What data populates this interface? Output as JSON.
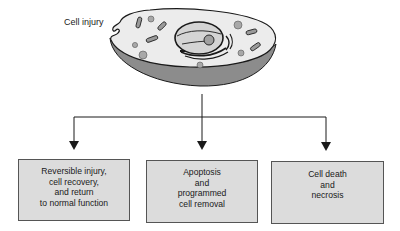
{
  "diagram": {
    "title": "Cell injury",
    "source_node": {
      "label": "Cell injury",
      "icon": "cell-illustration-icon"
    },
    "outcomes": [
      {
        "lines": [
          "Reversible injury,",
          "cell recovery,",
          "and return",
          "to normal function"
        ]
      },
      {
        "lines": [
          "Apoptosis",
          "and",
          "programmed",
          "cell removal"
        ]
      },
      {
        "lines": [
          "Cell death",
          "and",
          "necrosis"
        ]
      }
    ],
    "colors": {
      "box_fill": "#dcdcdc",
      "box_border": "#555555",
      "cell_cytoplasm": "#ececec",
      "cell_base": "#8c8c8c",
      "organelle": "#a8a8a8",
      "line": "#1a1a1a"
    }
  }
}
